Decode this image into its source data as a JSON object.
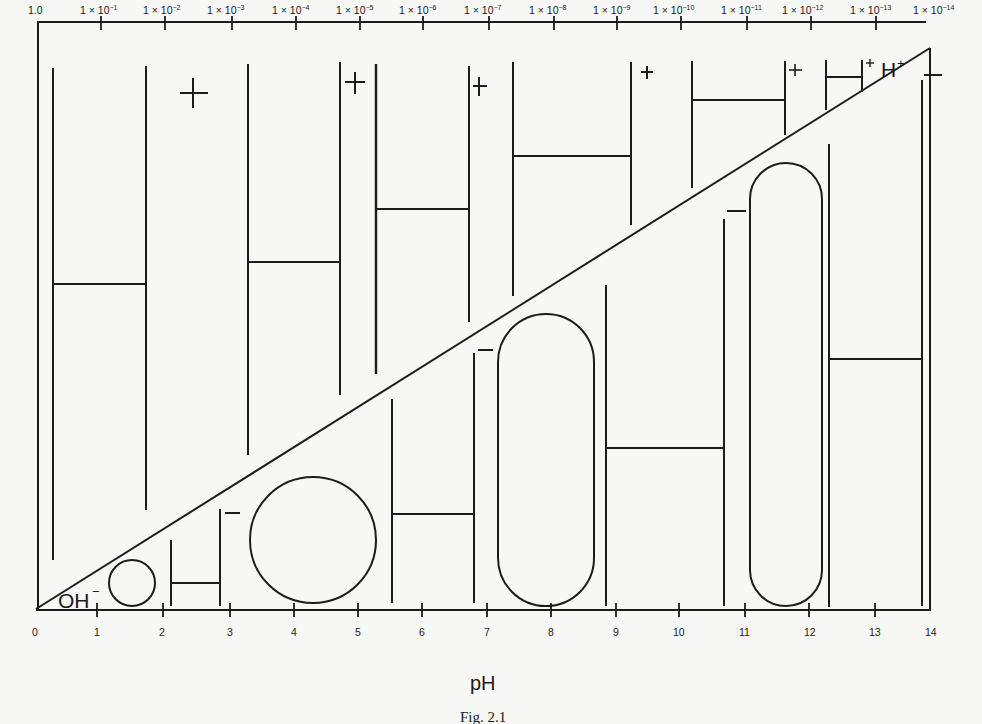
{
  "figure": {
    "caption": "Fig. 2.1",
    "bottom_axis": {
      "title": "pH",
      "ticks": [
        "0",
        "1",
        "2",
        "3",
        "4",
        "5",
        "6",
        "7",
        "8",
        "9",
        "10",
        "11",
        "12",
        "13",
        "14"
      ]
    },
    "top_axis": {
      "title": "[H+] concentration (mol/L)",
      "ticks": [
        {
          "mantissa": "1.0",
          "exp": ""
        },
        {
          "mantissa": "1 × 10",
          "exp": "−1"
        },
        {
          "mantissa": "1 × 10",
          "exp": "−2"
        },
        {
          "mantissa": "1 × 10",
          "exp": "−3"
        },
        {
          "mantissa": "1 × 10",
          "exp": "−4"
        },
        {
          "mantissa": "1 × 10",
          "exp": "−5"
        },
        {
          "mantissa": "1 × 10",
          "exp": "−6"
        },
        {
          "mantissa": "1 × 10",
          "exp": "−7"
        },
        {
          "mantissa": "1 × 10",
          "exp": "−8"
        },
        {
          "mantissa": "1 × 10",
          "exp": "−9"
        },
        {
          "mantissa": "1 × 10",
          "exp": "−10"
        },
        {
          "mantissa": "1 × 10",
          "exp": "−11"
        },
        {
          "mantissa": "1 × 10",
          "exp": "−12"
        },
        {
          "mantissa": "1 × 10",
          "exp": "−13"
        },
        {
          "mantissa": "1 × 10",
          "exp": "−14"
        }
      ]
    },
    "labels": {
      "h_plus": "H",
      "h_plus_sign": "+",
      "oh_minus": "OH",
      "oh_minus_sign": "−"
    },
    "diagonal": "Concentration of H+ decreases while OH− increases from pH 0 to 14",
    "ink_color": "#1c1c1c",
    "paper_color": "#f7f7f5"
  }
}
